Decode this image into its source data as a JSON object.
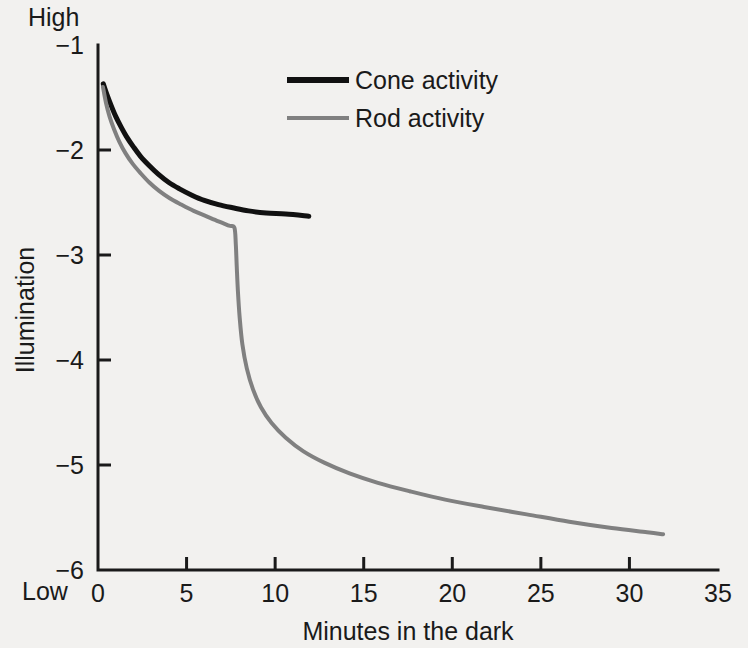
{
  "chart_data": {
    "type": "line",
    "title": "",
    "xlabel": "Minutes in the dark",
    "ylabel": "Illumination",
    "xlim": [
      0,
      35
    ],
    "ylim": [
      -6,
      -1
    ],
    "grid": false,
    "legend_position": "top-center",
    "x_ticks": [
      "0",
      "5",
      "10",
      "15",
      "20",
      "25",
      "30",
      "35"
    ],
    "x_tick_values": [
      0,
      5,
      10,
      15,
      20,
      25,
      30,
      35
    ],
    "y_ticks": [
      "-1",
      "-2",
      "-3",
      "-4",
      "-5",
      "-6"
    ],
    "y_tick_values": [
      -1,
      -2,
      -3,
      -4,
      -5,
      -6
    ],
    "y_axis_high_label": "High",
    "y_axis_low_label": "Low",
    "series": [
      {
        "name": "Cone activity",
        "color": "#111111",
        "width": 5,
        "points": [
          [
            0.3,
            -1.37
          ],
          [
            0.5,
            -1.47
          ],
          [
            0.75,
            -1.58
          ],
          [
            1.0,
            -1.68
          ],
          [
            1.3,
            -1.78
          ],
          [
            1.6,
            -1.87
          ],
          [
            2.0,
            -1.97
          ],
          [
            2.4,
            -2.06
          ],
          [
            2.9,
            -2.15
          ],
          [
            3.4,
            -2.23
          ],
          [
            4.0,
            -2.31
          ],
          [
            4.6,
            -2.37
          ],
          [
            5.3,
            -2.43
          ],
          [
            6.0,
            -2.48
          ],
          [
            6.8,
            -2.52
          ],
          [
            7.6,
            -2.55
          ],
          [
            8.5,
            -2.58
          ],
          [
            9.5,
            -2.6
          ],
          [
            10.6,
            -2.61
          ],
          [
            11.9,
            -2.63
          ]
        ]
      },
      {
        "name": "Rod activity",
        "color": "#808080",
        "width": 4,
        "points": [
          [
            0.28,
            -1.4
          ],
          [
            0.45,
            -1.55
          ],
          [
            0.65,
            -1.68
          ],
          [
            0.9,
            -1.8
          ],
          [
            1.2,
            -1.92
          ],
          [
            1.55,
            -2.03
          ],
          [
            1.95,
            -2.13
          ],
          [
            2.4,
            -2.22
          ],
          [
            2.9,
            -2.31
          ],
          [
            3.45,
            -2.39
          ],
          [
            4.05,
            -2.46
          ],
          [
            4.7,
            -2.52
          ],
          [
            5.4,
            -2.58
          ],
          [
            6.1,
            -2.63
          ],
          [
            6.8,
            -2.68
          ],
          [
            7.4,
            -2.72
          ],
          [
            7.7,
            -2.74
          ],
          [
            7.78,
            -2.9
          ],
          [
            7.83,
            -3.1
          ],
          [
            7.9,
            -3.35
          ],
          [
            8.0,
            -3.6
          ],
          [
            8.15,
            -3.85
          ],
          [
            8.4,
            -4.08
          ],
          [
            8.75,
            -4.28
          ],
          [
            9.2,
            -4.45
          ],
          [
            9.8,
            -4.6
          ],
          [
            10.6,
            -4.74
          ],
          [
            11.6,
            -4.87
          ],
          [
            12.8,
            -4.98
          ],
          [
            14.2,
            -5.08
          ],
          [
            15.8,
            -5.17
          ],
          [
            17.6,
            -5.25
          ],
          [
            19.6,
            -5.33
          ],
          [
            21.8,
            -5.4
          ],
          [
            24.2,
            -5.47
          ],
          [
            26.6,
            -5.54
          ],
          [
            29.0,
            -5.6
          ],
          [
            31.0,
            -5.64
          ],
          [
            31.9,
            -5.66
          ]
        ]
      }
    ],
    "annotations": {
      "rod_cone_break_minutes": 7.7,
      "rod_cone_break_illumination": -2.74
    }
  },
  "legend": {
    "items": [
      {
        "label": "Cone activity",
        "color": "#111111"
      },
      {
        "label": "Rod activity",
        "color": "#808080"
      }
    ]
  }
}
